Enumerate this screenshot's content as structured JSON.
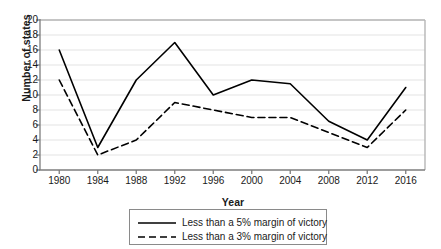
{
  "chart_data": {
    "type": "line",
    "title": "",
    "xlabel": "Year",
    "ylabel": "Number of states",
    "x": [
      1980,
      1984,
      1988,
      1992,
      1996,
      2000,
      2004,
      2008,
      2012,
      2016
    ],
    "categories": [
      "1980",
      "1984",
      "1988",
      "1992",
      "1996",
      "2000",
      "2004",
      "2008",
      "2012",
      "2016"
    ],
    "xlim": [
      1978,
      2018
    ],
    "ylim": [
      0,
      20
    ],
    "ytick_values": [
      0,
      2,
      4,
      6,
      8,
      10,
      12,
      14,
      16,
      18,
      20
    ],
    "ytick_labels": [
      "0",
      "2",
      "4",
      "6",
      "8",
      "10",
      "12",
      "14",
      "16",
      "18",
      "20"
    ],
    "grid": "horizontal",
    "legend_position": "below",
    "series": [
      {
        "name": "Less than a 5% margin of victory",
        "style": "solid",
        "color": "#000000",
        "values": [
          16,
          3,
          12,
          17,
          10,
          12,
          11.5,
          6.5,
          4,
          11
        ]
      },
      {
        "name": "Less than a 3% margin of victory",
        "style": "dashed",
        "color": "#000000",
        "values": [
          12,
          2,
          4,
          9,
          8,
          7,
          7,
          5,
          3,
          8
        ]
      }
    ]
  },
  "legend": {
    "items": [
      {
        "label": "Less than a 5% margin of victory",
        "style": "solid"
      },
      {
        "label": "Less than a 3% margin of victory",
        "style": "dashed"
      }
    ]
  },
  "colors": {
    "line": "#000000",
    "grid": "#e3e3e3",
    "axis": "#7d7d7d",
    "legend_border": "#8a8a8a",
    "text": "#1a1a1a",
    "background": "#ffffff"
  }
}
